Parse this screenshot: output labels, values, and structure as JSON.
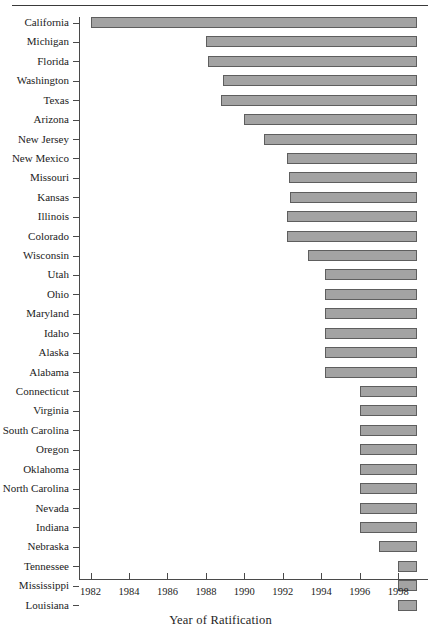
{
  "chart_data": {
    "type": "bar",
    "orientation": "horizontal",
    "title": "",
    "xlabel": "Year of Ratification",
    "ylabel": "",
    "xlim": [
      1981.4,
      1999.5
    ],
    "xticks": [
      1982,
      1984,
      1986,
      1988,
      1990,
      1992,
      1994,
      1996,
      1998
    ],
    "xticklabels": [
      "1982",
      "1984",
      "1986",
      "1988",
      "1990",
      "1992",
      "1994",
      "1996",
      "1998"
    ],
    "grid": false,
    "legend": null,
    "bar_end_year": 1999,
    "note": "Each horizontal bar spans from the state's year of ratification to 1999.",
    "categories": [
      "California",
      "Michigan",
      "Florida",
      "Washington",
      "Texas",
      "Arizona",
      "New Jersey",
      "New Mexico",
      "Missouri",
      "Kansas",
      "Illinois",
      "Colorado",
      "Wisconsin",
      "Utah",
      "Ohio",
      "Maryland",
      "Idaho",
      "Alaska",
      "Alabama",
      "Connecticut",
      "Virginia",
      "South Carolina",
      "Oregon",
      "Oklahoma",
      "North Carolina",
      "Nevada",
      "Indiana",
      "Nebraska",
      "Tennessee",
      "Mississippi",
      "Louisiana"
    ],
    "values": [
      1982.0,
      1988.0,
      1988.1,
      1988.9,
      1988.8,
      1990.0,
      1991.0,
      1992.2,
      1992.3,
      1992.4,
      1992.2,
      1992.2,
      1993.3,
      1994.2,
      1994.2,
      1994.2,
      1994.2,
      1994.2,
      1994.2,
      1996.0,
      1996.0,
      1996.0,
      1996.0,
      1996.0,
      1996.0,
      1996.0,
      1996.0,
      1997.0,
      1998.0,
      1998.0,
      1998.0
    ],
    "bars": [
      {
        "label": "California",
        "start": 1982.0,
        "end": 1999
      },
      {
        "label": "Michigan",
        "start": 1988.0,
        "end": 1999
      },
      {
        "label": "Florida",
        "start": 1988.1,
        "end": 1999
      },
      {
        "label": "Washington",
        "start": 1988.9,
        "end": 1999
      },
      {
        "label": "Texas",
        "start": 1988.8,
        "end": 1999
      },
      {
        "label": "Arizona",
        "start": 1990.0,
        "end": 1999
      },
      {
        "label": "New Jersey",
        "start": 1991.0,
        "end": 1999
      },
      {
        "label": "New Mexico",
        "start": 1992.2,
        "end": 1999
      },
      {
        "label": "Missouri",
        "start": 1992.3,
        "end": 1999
      },
      {
        "label": "Kansas",
        "start": 1992.4,
        "end": 1999
      },
      {
        "label": "Illinois",
        "start": 1992.2,
        "end": 1999
      },
      {
        "label": "Colorado",
        "start": 1992.2,
        "end": 1999
      },
      {
        "label": "Wisconsin",
        "start": 1993.3,
        "end": 1999
      },
      {
        "label": "Utah",
        "start": 1994.2,
        "end": 1999
      },
      {
        "label": "Ohio",
        "start": 1994.2,
        "end": 1999
      },
      {
        "label": "Maryland",
        "start": 1994.2,
        "end": 1999
      },
      {
        "label": "Idaho",
        "start": 1994.2,
        "end": 1999
      },
      {
        "label": "Alaska",
        "start": 1994.2,
        "end": 1999
      },
      {
        "label": "Alabama",
        "start": 1994.2,
        "end": 1999
      },
      {
        "label": "Connecticut",
        "start": 1996.0,
        "end": 1999
      },
      {
        "label": "Virginia",
        "start": 1996.0,
        "end": 1999
      },
      {
        "label": "South Carolina",
        "start": 1996.0,
        "end": 1999
      },
      {
        "label": "Oregon",
        "start": 1996.0,
        "end": 1999
      },
      {
        "label": "Oklahoma",
        "start": 1996.0,
        "end": 1999
      },
      {
        "label": "North Carolina",
        "start": 1996.0,
        "end": 1999
      },
      {
        "label": "Nevada",
        "start": 1996.0,
        "end": 1999
      },
      {
        "label": "Indiana",
        "start": 1996.0,
        "end": 1999
      },
      {
        "label": "Nebraska",
        "start": 1997.0,
        "end": 1999
      },
      {
        "label": "Tennessee",
        "start": 1998.0,
        "end": 1999
      },
      {
        "label": "Mississippi",
        "start": 1998.0,
        "end": 1999
      },
      {
        "label": "Louisiana",
        "start": 1998.0,
        "end": 1999
      }
    ]
  },
  "style": {
    "bar_fill": "#a3a3a3",
    "bar_stroke": "#5e5e5e",
    "axis_color": "#4a4a4a",
    "text_color": "#222222",
    "background": "#ffffff"
  }
}
